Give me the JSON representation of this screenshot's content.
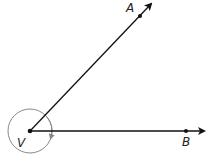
{
  "diagram": {
    "type": "angle",
    "vertex": {
      "label": "V",
      "x": 30,
      "y": 131
    },
    "points": [
      {
        "label": "A",
        "x": 140,
        "y": 16
      },
      {
        "label": "B",
        "x": 186,
        "y": 131
      }
    ],
    "rays": [
      {
        "name": "ray-VA",
        "from": "V",
        "through": "A"
      },
      {
        "name": "ray-VB",
        "from": "V",
        "through": "B"
      }
    ],
    "angle_mark": {
      "type": "reflex-circle-arc",
      "direction": "clockwise",
      "radius": 22
    },
    "colors": {
      "line": "#111111",
      "circle": "#888888"
    }
  }
}
